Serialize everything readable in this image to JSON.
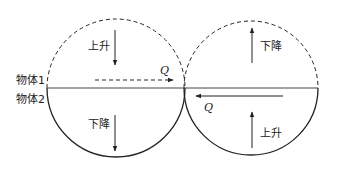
{
  "labels": {
    "object1": "物体1",
    "object2": "物体2",
    "left_top": "上升",
    "left_bottom": "下降",
    "right_top": "下降",
    "right_bottom": "上升",
    "q_top": "Q",
    "q_bottom": "Q"
  },
  "colors": {
    "stroke": "#222222",
    "background": "#ffffff"
  }
}
